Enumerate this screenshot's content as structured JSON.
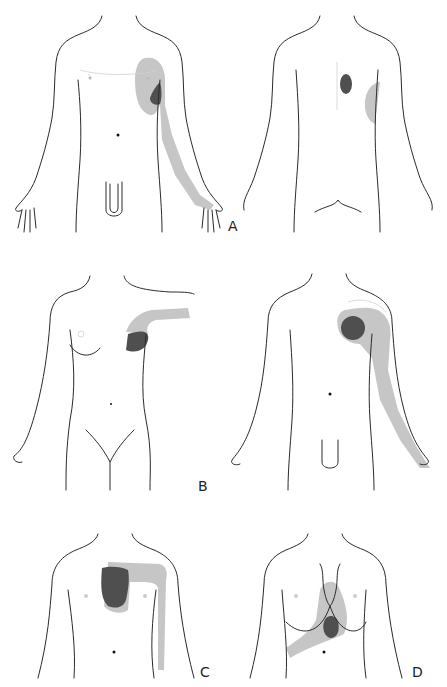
{
  "figure": {
    "panels": [
      {
        "id": "A",
        "label": "A",
        "view": "male anterior and posterior",
        "description": "Referred pain: left chest/shoulder and medial left arm (anterior); interscapular and left lateral chest (posterior)"
      },
      {
        "id": "B",
        "label": "B",
        "view": "female anterior",
        "description": "Referred pain: left breast area extending along left arm"
      },
      {
        "id": "unlabeled",
        "label": "",
        "view": "male anterior",
        "description": "Referred pain: left upper chest/shoulder extending down medial left arm"
      },
      {
        "id": "C",
        "label": "C",
        "view": "torso anterior",
        "description": "Referred pain: substernal area extending across to left arm"
      },
      {
        "id": "D",
        "label": "D",
        "view": "torso anterior",
        "description": "Referred pain: epigastric / lower chest region extending to right"
      }
    ],
    "colors": {
      "outline": "#2a2a2a",
      "referred_pain_light": "#c6c6c6",
      "primary_pain_dark": "#4f4f4f",
      "background": "#ffffff"
    }
  }
}
